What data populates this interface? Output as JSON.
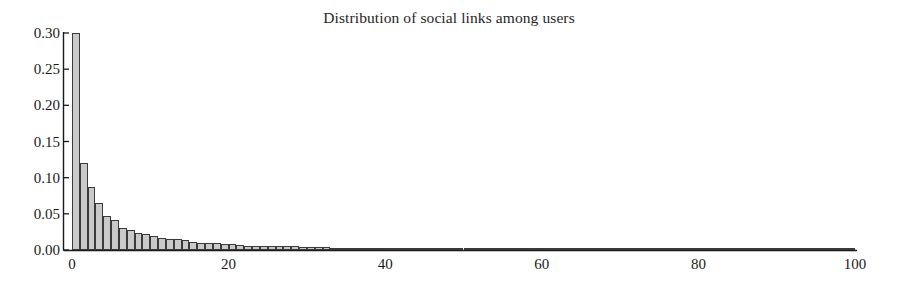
{
  "chart_data": {
    "type": "bar",
    "title": "Distribution of social links among users",
    "xlabel": "",
    "ylabel": "",
    "xlim": [
      0,
      100
    ],
    "ylim": [
      0.0,
      0.3
    ],
    "grid": false,
    "legend": null,
    "bar_color": "#c9c9c9",
    "bar_edge_color": "#3a3a3a",
    "axis_color": "#1a1a1a",
    "xticks": [
      0,
      20,
      40,
      60,
      80,
      100
    ],
    "xtick_labels": [
      "0",
      "20",
      "40",
      "60",
      "80",
      "100"
    ],
    "yticks": [
      0.0,
      0.05,
      0.1,
      0.15,
      0.2,
      0.25,
      0.3
    ],
    "ytick_labels": [
      "0.00",
      "0.05",
      "0.10",
      "0.15",
      "0.20",
      "0.25",
      "0.30"
    ],
    "bar_width": 1,
    "categories": [
      0,
      1,
      2,
      3,
      4,
      5,
      6,
      7,
      8,
      9,
      10,
      11,
      12,
      13,
      14,
      15,
      16,
      17,
      18,
      19,
      20,
      21,
      22,
      23,
      24,
      25,
      26,
      27,
      28,
      29,
      30,
      31,
      32,
      33,
      34,
      35,
      36,
      37,
      38,
      39,
      40,
      41,
      42,
      43,
      44,
      45,
      46,
      47,
      48,
      49,
      50,
      51,
      52,
      53,
      54,
      55,
      56,
      57,
      58,
      59,
      60,
      61,
      62,
      63,
      64,
      65,
      66,
      67,
      68,
      69,
      70,
      71,
      72,
      73,
      74,
      75,
      76,
      77,
      78,
      79,
      80,
      81,
      82,
      83,
      84,
      85,
      86,
      87,
      88,
      89,
      90,
      91,
      92,
      93,
      94,
      95,
      96,
      97,
      98,
      99
    ],
    "values": [
      0.3,
      0.12,
      0.087,
      0.065,
      0.047,
      0.042,
      0.031,
      0.027,
      0.024,
      0.022,
      0.019,
      0.016,
      0.015,
      0.015,
      0.014,
      0.011,
      0.009,
      0.009,
      0.009,
      0.008,
      0.008,
      0.007,
      0.006,
      0.006,
      0.006,
      0.005,
      0.005,
      0.006,
      0.005,
      0.004,
      0.004,
      0.004,
      0.004,
      0.003,
      0.003,
      0.003,
      0.003,
      0.003,
      0.003,
      0.003,
      0.003,
      0.002,
      0.002,
      0.002,
      0.002,
      0.002,
      0.002,
      0.002,
      0.002,
      0.002,
      0.002,
      0.002,
      0.002,
      0.002,
      0.002,
      0.003,
      0.002,
      0.002,
      0.002,
      0.001,
      0.001,
      0.001,
      0.001,
      0.001,
      0.001,
      0.001,
      0.001,
      0.001,
      0.001,
      0.001,
      0.001,
      0.001,
      0.001,
      0.001,
      0.001,
      0.001,
      0.001,
      0.001,
      0.001,
      0.001,
      0.001,
      0.001,
      0.001,
      0.001,
      0.001,
      0.001,
      0.001,
      0.001,
      0.001,
      0.001,
      0.001,
      0.001,
      0.001,
      0.001,
      0.001,
      0.001,
      0.001,
      0.001,
      0.001,
      0.001
    ]
  }
}
